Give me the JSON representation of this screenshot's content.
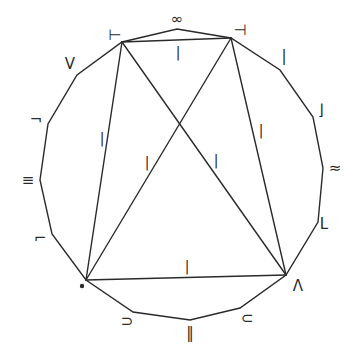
{
  "diagram": {
    "title": "",
    "polygon_vertices": [
      {
        "id": "top",
        "x": 177,
        "y": 29,
        "label": "∞",
        "lx": 177,
        "ly": 19
      },
      {
        "id": "TR",
        "x": 231,
        "y": 38,
        "label": "⊣",
        "lx": 240,
        "ly": 30
      },
      {
        "id": "r1",
        "x": 280,
        "y": 70,
        "label": "|",
        "lx": 284,
        "ly": 56
      },
      {
        "id": "r2",
        "x": 313,
        "y": 117,
        "label": "⌋",
        "lx": 321,
        "ly": 110
      },
      {
        "id": "r3",
        "x": 323,
        "y": 168,
        "label": "≈",
        "lx": 335,
        "ly": 168
      },
      {
        "id": "r4",
        "x": 318,
        "y": 222,
        "label": "L",
        "lx": 324,
        "ly": 224
      },
      {
        "id": "BR",
        "x": 286,
        "y": 275,
        "label": "Λ",
        "lx": 298,
        "ly": 286
      },
      {
        "id": "b1",
        "x": 240,
        "y": 308,
        "label": "⊂",
        "lx": 247,
        "ly": 318
      },
      {
        "id": "bot",
        "x": 190,
        "y": 320,
        "label": "‖",
        "lx": 190,
        "ly": 333
      },
      {
        "id": "b2",
        "x": 133,
        "y": 312,
        "label": "⊃",
        "lx": 127,
        "ly": 321
      },
      {
        "id": "BL",
        "x": 86,
        "y": 280,
        "label": "•",
        "lx": 82,
        "ly": 286
      },
      {
        "id": "l1",
        "x": 52,
        "y": 234,
        "label": "⌐",
        "lx": 40,
        "ly": 238
      },
      {
        "id": "l2",
        "x": 40,
        "y": 180,
        "label": "≡",
        "lx": 28,
        "ly": 180
      },
      {
        "id": "l3",
        "x": 48,
        "y": 124,
        "label": "¬",
        "lx": 36,
        "ly": 120
      },
      {
        "id": "l4",
        "x": 77,
        "y": 75,
        "label": "V",
        "lx": 70,
        "ly": 64
      },
      {
        "id": "TL",
        "x": 122,
        "y": 42,
        "label": "⊢",
        "lx": 115,
        "ly": 35
      }
    ],
    "interior_edges": [
      {
        "from": "TL",
        "to": "TR",
        "label": "|",
        "lx": 178,
        "ly": 52
      },
      {
        "from": "TL",
        "to": "BL",
        "label": "|",
        "lx": 102,
        "ly": 138
      },
      {
        "from": "TR",
        "to": "BR",
        "label": "|",
        "lx": 261,
        "ly": 130
      },
      {
        "from": "BL",
        "to": "BR",
        "label": "|",
        "lx": 187,
        "ly": 266
      },
      {
        "from": "BL",
        "to": "TR",
        "label": "|",
        "lx": 147,
        "ly": 162
      },
      {
        "from": "TL",
        "to": "BR",
        "label": "|",
        "lx": 216,
        "ly": 160
      }
    ],
    "colors": {
      "stroke": "#2a2a2a",
      "background": "#ffffff"
    }
  }
}
